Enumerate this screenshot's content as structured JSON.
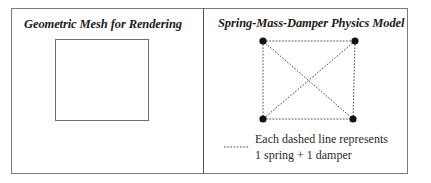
{
  "figure": {
    "left_panel": {
      "title": "Geometric Mesh for Rendering",
      "shape": "square"
    },
    "right_panel": {
      "title": "Spring-Mass-Damper Physics Model",
      "nodes": [
        {
          "id": "top-left"
        },
        {
          "id": "top-right"
        },
        {
          "id": "bottom-left"
        },
        {
          "id": "bottom-right"
        }
      ],
      "edges": [
        [
          "top-left",
          "top-right"
        ],
        [
          "top-left",
          "bottom-left"
        ],
        [
          "top-right",
          "bottom-right"
        ],
        [
          "bottom-left",
          "bottom-right"
        ],
        [
          "top-left",
          "bottom-right"
        ],
        [
          "top-right",
          "bottom-left"
        ]
      ],
      "legend": {
        "line_style": "dashed",
        "line1": "Each dashed line represents",
        "line2": "1 spring + 1 damper"
      }
    },
    "colors": {
      "border": "#7a7a7a",
      "square": "#6e6e6e",
      "node": "#111111",
      "dashed": "#444444"
    }
  }
}
